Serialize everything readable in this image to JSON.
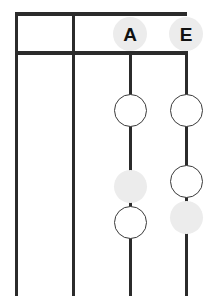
{
  "diagram": {
    "type": "two-column-node-chart",
    "background_color": "#ffffff",
    "line_color": "#2b2b2b",
    "node_outline_color": "#3a3a3a",
    "node_open_fill": "#ffffff",
    "node_filled_fill": "#ececec",
    "label_badge_fill": "#ececec",
    "label_text_color": "#111111",
    "grid": {
      "top_rule": {
        "x": 15,
        "y": 12,
        "width": 172,
        "height": 4
      },
      "second_rule": {
        "x": 15,
        "y": 51,
        "width": 172,
        "height": 4
      },
      "vertical_lines": [
        {
          "name": "left-border",
          "x": 15,
          "y": 12,
          "height": 284,
          "width": 3
        },
        {
          "name": "column-divider",
          "x": 72,
          "y": 12,
          "height": 284,
          "width": 3
        },
        {
          "name": "stem-a",
          "x": 129,
          "y": 51,
          "height": 245,
          "width": 3
        },
        {
          "name": "stem-e",
          "x": 185,
          "y": 51,
          "height": 245,
          "width": 3
        }
      ]
    },
    "columns": [
      {
        "label": "A",
        "label_center_x": 130,
        "label_center_y": 34,
        "label_diameter": 34,
        "nodes": [
          {
            "state": "open",
            "center_x": 130,
            "center_y": 110,
            "diameter": 33
          },
          {
            "state": "filled",
            "center_x": 130,
            "center_y": 186,
            "diameter": 33
          },
          {
            "state": "open",
            "center_x": 130,
            "center_y": 222,
            "diameter": 33
          }
        ]
      },
      {
        "label": "E",
        "label_center_x": 186,
        "label_center_y": 34,
        "label_diameter": 34,
        "nodes": [
          {
            "state": "open",
            "center_x": 186,
            "center_y": 110,
            "diameter": 33
          },
          {
            "state": "open",
            "center_x": 186,
            "center_y": 181,
            "diameter": 33
          },
          {
            "state": "filled",
            "center_x": 186,
            "center_y": 217,
            "diameter": 33
          }
        ]
      }
    ]
  }
}
